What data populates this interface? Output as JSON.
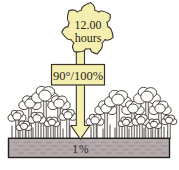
{
  "diagram": {
    "sun": {
      "label_line1": "12.00",
      "label_line2": "hours"
    },
    "arrow_label": "90°/100%",
    "ground_label": "1%",
    "colors": {
      "sun_fill": "#f4efae",
      "outline": "#3a3328",
      "ground_fill": "#b3a9ab",
      "ground_border": "#211f1b",
      "text": "#2a241f",
      "tree_fill": "#ffffff",
      "background": "#ffffff"
    }
  }
}
